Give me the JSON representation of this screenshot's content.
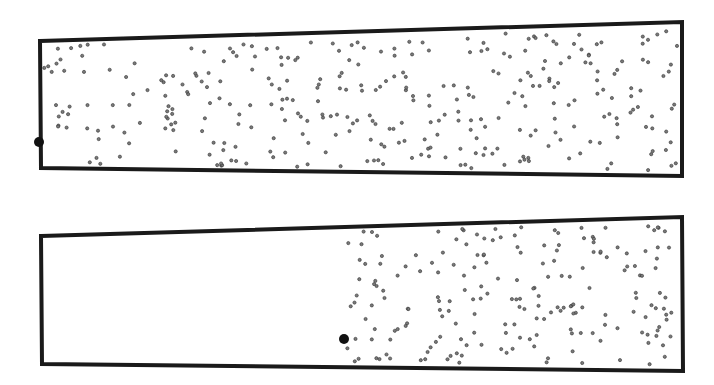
{
  "colors": {
    "background": "#ffffff",
    "stroke": "#1a1a1a",
    "dot_fill": "#7a7a7a",
    "dot_stroke": "#333333",
    "tracer": "#111111"
  },
  "panels": [
    {
      "name": "top-container",
      "outline": [
        [
          40,
          41
        ],
        [
          682,
          22
        ],
        [
          682,
          176
        ],
        [
          41,
          168
        ]
      ],
      "tracer": {
        "x": 39,
        "y": 142,
        "r": 5
      },
      "region": {
        "x0": 44,
        "x1": 678,
        "n": 330,
        "seed": 11
      }
    },
    {
      "name": "bottom-container",
      "outline": [
        [
          41,
          236
        ],
        [
          682,
          217
        ],
        [
          683,
          371
        ],
        [
          42,
          364
        ]
      ],
      "tracer": {
        "x": 344,
        "y": 339,
        "r": 5
      },
      "region": {
        "x0": 345,
        "x1": 679,
        "n": 200,
        "seed": 29
      }
    }
  ]
}
